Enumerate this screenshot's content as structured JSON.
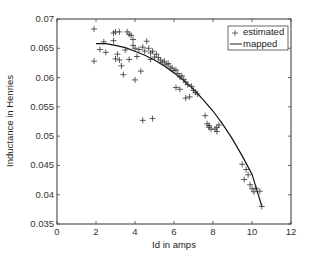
{
  "chart_data": {
    "type": "scatter",
    "title": "",
    "xlabel": "Id in amps",
    "ylabel": "Inductance in Henries",
    "xlim": [
      0,
      12
    ],
    "ylim": [
      0.035,
      0.07
    ],
    "xticks": [
      0,
      2,
      4,
      6,
      8,
      10,
      12
    ],
    "yticks": [
      0.035,
      0.04,
      0.045,
      0.05,
      0.055,
      0.06,
      0.065,
      0.07
    ],
    "xtick_labels": [
      "0",
      "2",
      "4",
      "6",
      "8",
      "10",
      "12"
    ],
    "ytick_labels": [
      "0.035",
      "0.04",
      "0.045",
      "0.05",
      "0.055",
      "0.06",
      "0.065",
      "0.07"
    ],
    "grid": false,
    "legend_position": "upper right",
    "legend": [
      "estimated",
      "mapped"
    ],
    "series": [
      {
        "name": "estimated",
        "style": "plus-markers",
        "points": [
          [
            1.9,
            0.0683
          ],
          [
            1.9,
            0.0628
          ],
          [
            2.2,
            0.0648
          ],
          [
            2.4,
            0.0661
          ],
          [
            2.5,
            0.0643
          ],
          [
            2.9,
            0.0676
          ],
          [
            3.0,
            0.0678
          ],
          [
            3.2,
            0.0678
          ],
          [
            2.9,
            0.0663
          ],
          [
            3.0,
            0.0632
          ],
          [
            3.1,
            0.064
          ],
          [
            3.2,
            0.063
          ],
          [
            3.3,
            0.062
          ],
          [
            3.4,
            0.0605
          ],
          [
            3.5,
            0.0647
          ],
          [
            3.6,
            0.0678
          ],
          [
            3.7,
            0.0674
          ],
          [
            3.8,
            0.0672
          ],
          [
            3.9,
            0.0665
          ],
          [
            3.7,
            0.0631
          ],
          [
            3.9,
            0.0655
          ],
          [
            4.0,
            0.065
          ],
          [
            4.1,
            0.0636
          ],
          [
            4.0,
            0.0596
          ],
          [
            4.2,
            0.0648
          ],
          [
            4.3,
            0.0611
          ],
          [
            4.4,
            0.0652
          ],
          [
            4.5,
            0.0645
          ],
          [
            4.6,
            0.0662
          ],
          [
            4.7,
            0.065
          ],
          [
            4.8,
            0.0642
          ],
          [
            4.9,
            0.0645
          ],
          [
            4.8,
            0.0631
          ],
          [
            5.0,
            0.0635
          ],
          [
            5.1,
            0.064
          ],
          [
            5.2,
            0.0634
          ],
          [
            5.3,
            0.063
          ],
          [
            5.4,
            0.0626
          ],
          [
            5.5,
            0.0628
          ],
          [
            5.6,
            0.0622
          ],
          [
            5.7,
            0.0624
          ],
          [
            5.8,
            0.0618
          ],
          [
            5.9,
            0.0616
          ],
          [
            6.0,
            0.0612
          ],
          [
            6.1,
            0.0613
          ],
          [
            6.2,
            0.0607
          ],
          [
            6.3,
            0.0601
          ],
          [
            6.4,
            0.0603
          ],
          [
            6.5,
            0.0597
          ],
          [
            6.6,
            0.0592
          ],
          [
            6.7,
            0.0588
          ],
          [
            6.9,
            0.0585
          ],
          [
            7.0,
            0.0578
          ],
          [
            7.1,
            0.0575
          ],
          [
            7.2,
            0.0572
          ],
          [
            6.1,
            0.0583
          ],
          [
            6.3,
            0.058
          ],
          [
            6.8,
            0.0567
          ],
          [
            6.6,
            0.0565
          ],
          [
            4.4,
            0.0527
          ],
          [
            4.9,
            0.053
          ],
          [
            7.6,
            0.0535
          ],
          [
            7.7,
            0.0521
          ],
          [
            7.8,
            0.0518
          ],
          [
            7.9,
            0.0512
          ],
          [
            8.1,
            0.0512
          ],
          [
            8.2,
            0.0515
          ],
          [
            8.3,
            0.0519
          ],
          [
            8.2,
            0.0508
          ],
          [
            7.8,
            0.0515
          ],
          [
            9.5,
            0.0452
          ],
          [
            9.7,
            0.0443
          ],
          [
            9.8,
            0.0434
          ],
          [
            9.6,
            0.0426
          ],
          [
            9.9,
            0.0417
          ],
          [
            10.0,
            0.041
          ],
          [
            10.1,
            0.0405
          ],
          [
            10.2,
            0.0411
          ],
          [
            10.4,
            0.0406
          ],
          [
            10.5,
            0.038
          ]
        ]
      },
      {
        "name": "mapped",
        "style": "line",
        "points": [
          [
            2.0,
            0.0658
          ],
          [
            2.5,
            0.0658
          ],
          [
            3.0,
            0.0655
          ],
          [
            3.5,
            0.0651
          ],
          [
            4.0,
            0.0645
          ],
          [
            4.5,
            0.0638
          ],
          [
            5.0,
            0.063
          ],
          [
            5.5,
            0.062
          ],
          [
            6.0,
            0.0608
          ],
          [
            6.5,
            0.0595
          ],
          [
            7.0,
            0.058
          ],
          [
            7.5,
            0.0562
          ],
          [
            8.0,
            0.0543
          ],
          [
            8.5,
            0.052
          ],
          [
            9.0,
            0.0495
          ],
          [
            9.5,
            0.0466
          ],
          [
            10.0,
            0.0435
          ],
          [
            10.5,
            0.038
          ]
        ]
      }
    ]
  }
}
